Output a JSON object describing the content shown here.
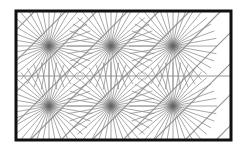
{
  "figure": {
    "type": "radial-line tiling pattern",
    "frame": {
      "x": 16,
      "y": 11,
      "width": 215,
      "height": 129,
      "stroke": "#111111",
      "stroke_width": 3
    },
    "line_color": "#8a8a8a",
    "center_glow_color": "#555555",
    "grid": {
      "columns": 3,
      "rows": 2
    },
    "star_centers": [
      {
        "x": 49,
        "y": 46
      },
      {
        "x": 111,
        "y": 46
      },
      {
        "x": 173,
        "y": 46
      },
      {
        "x": 49,
        "y": 106
      },
      {
        "x": 111,
        "y": 106
      },
      {
        "x": 173,
        "y": 106
      }
    ],
    "rays_per_star": 36,
    "ray_length": 44,
    "horizontal_divider_y": 76,
    "diagonal_spacing": 31
  }
}
